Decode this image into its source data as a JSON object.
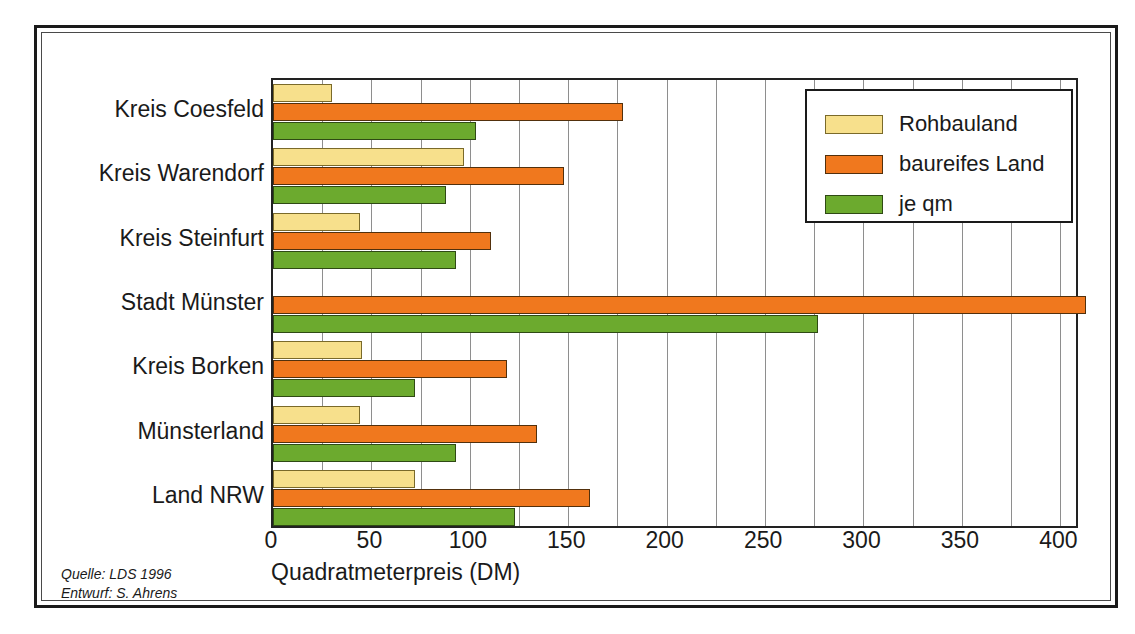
{
  "chart_data": {
    "type": "bar",
    "orientation": "horizontal",
    "title": "",
    "xlabel": "Quadratmeterpreis (DM)",
    "ylabel": "",
    "xlim": [
      0,
      410
    ],
    "xticks": [
      0,
      50,
      100,
      150,
      200,
      250,
      300,
      350,
      400
    ],
    "minor_tick_step": 25,
    "grid": true,
    "legend_position": "top-right",
    "categories": [
      "Kreis Coesfeld",
      "Kreis Warendorf",
      "Kreis Steinfurt",
      "Stadt Münster",
      "Kreis Borken",
      "Münsterland",
      "Land NRW"
    ],
    "series": [
      {
        "name": "Rohbauland",
        "color": "#f7e08c",
        "values": [
          30,
          97,
          44,
          null,
          45,
          44,
          72
        ]
      },
      {
        "name": "baureifes Land",
        "color": "#f0781e",
        "values": [
          178,
          148,
          111,
          413,
          119,
          134,
          161
        ]
      },
      {
        "name": "je qm",
        "color": "#6caa2e",
        "values": [
          103,
          88,
          93,
          277,
          72,
          93,
          123
        ]
      }
    ]
  },
  "legend": {
    "entries": [
      {
        "label": "Rohbauland",
        "color": "#f7e08c"
      },
      {
        "label": "baureifes Land",
        "color": "#f0781e"
      },
      {
        "label": "je qm",
        "color": "#6caa2e"
      }
    ]
  },
  "axis": {
    "x_title": "Quadratmeterpreis (DM)",
    "tick_labels": [
      "0",
      "50",
      "100",
      "150",
      "200",
      "250",
      "300",
      "350",
      "400"
    ]
  },
  "source_note": {
    "line1": "Quelle: LDS 1996",
    "line2": "Entwurf: S. Ahrens"
  }
}
